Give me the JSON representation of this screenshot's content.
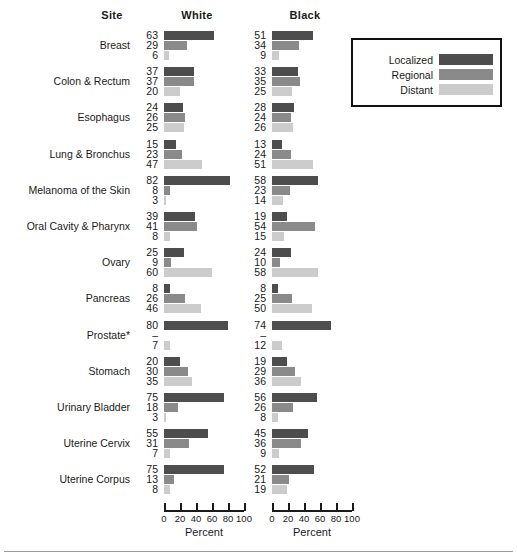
{
  "header": {
    "site_label": "Site",
    "white_label": "White",
    "black_label": "Black"
  },
  "legend": {
    "items": [
      {
        "label": "Localized",
        "color": "#4d4d4d"
      },
      {
        "label": "Regional",
        "color": "#8a8a8a"
      },
      {
        "label": "Distant",
        "color": "#cccccc"
      }
    ]
  },
  "axis": {
    "title": "Percent",
    "ticks": [
      "0",
      "20",
      "40",
      "60",
      "80",
      "100"
    ],
    "min": 0,
    "max": 100
  },
  "chart_data": {
    "type": "bar",
    "title": "",
    "subtitle": "",
    "xlabel": "Percent",
    "ylabel": "Site",
    "xlim": [
      0,
      100
    ],
    "grid": false,
    "orientation": "horizontal",
    "legend_position": "top-right",
    "panels": [
      "White",
      "Black"
    ],
    "stage_series": [
      "Localized",
      "Regional",
      "Distant"
    ],
    "categories": [
      "Breast",
      "Colon & Rectum",
      "Esophagus",
      "Lung & Bronchus",
      "Melanoma of the Skin",
      "Oral Cavity & Pharynx",
      "Ovary",
      "Pancreas",
      "Prostate*",
      "Stomach",
      "Urinary Bladder",
      "Uterine Cervix",
      "Uterine Corpus"
    ],
    "rows": [
      {
        "site": "Breast",
        "white": {
          "labels": [
            "63",
            "29",
            "6"
          ],
          "values": [
            63,
            29,
            6
          ]
        },
        "black": {
          "labels": [
            "51",
            "34",
            "9"
          ],
          "values": [
            51,
            34,
            9
          ]
        }
      },
      {
        "site": "Colon & Rectum",
        "white": {
          "labels": [
            "37",
            "37",
            "20"
          ],
          "values": [
            37,
            37,
            20
          ]
        },
        "black": {
          "labels": [
            "33",
            "35",
            "25"
          ],
          "values": [
            33,
            35,
            25
          ]
        }
      },
      {
        "site": "Esophagus",
        "white": {
          "labels": [
            "24",
            "26",
            "25"
          ],
          "values": [
            24,
            26,
            25
          ]
        },
        "black": {
          "labels": [
            "28",
            "24",
            "26"
          ],
          "values": [
            28,
            24,
            26
          ]
        }
      },
      {
        "site": "Lung & Bronchus",
        "white": {
          "labels": [
            "15",
            "23",
            "47"
          ],
          "values": [
            15,
            23,
            47
          ]
        },
        "black": {
          "labels": [
            "13",
            "24",
            "51"
          ],
          "values": [
            13,
            24,
            51
          ]
        }
      },
      {
        "site": "Melanoma of the Skin",
        "white": {
          "labels": [
            "82",
            "8",
            "3"
          ],
          "values": [
            82,
            8,
            3
          ]
        },
        "black": {
          "labels": [
            "58",
            "23",
            "14"
          ],
          "values": [
            58,
            23,
            14
          ]
        }
      },
      {
        "site": "Oral Cavity & Pharynx",
        "white": {
          "labels": [
            "39",
            "41",
            "8"
          ],
          "values": [
            39,
            41,
            8
          ]
        },
        "black": {
          "labels": [
            "19",
            "54",
            "15"
          ],
          "values": [
            19,
            54,
            15
          ]
        }
      },
      {
        "site": "Ovary",
        "white": {
          "labels": [
            "25",
            "9",
            "60"
          ],
          "values": [
            25,
            9,
            60
          ]
        },
        "black": {
          "labels": [
            "24",
            "10",
            "58"
          ],
          "values": [
            24,
            10,
            58
          ]
        }
      },
      {
        "site": "Pancreas",
        "white": {
          "labels": [
            "8",
            "26",
            "46"
          ],
          "values": [
            8,
            26,
            46
          ]
        },
        "black": {
          "labels": [
            "8",
            "25",
            "50"
          ],
          "values": [
            8,
            25,
            50
          ]
        }
      },
      {
        "site": "Prostate*",
        "white": {
          "labels": [
            "80",
            "–",
            "7"
          ],
          "values": [
            80,
            null,
            7
          ]
        },
        "black": {
          "labels": [
            "74",
            "–",
            "12"
          ],
          "values": [
            74,
            null,
            12
          ]
        }
      },
      {
        "site": "Stomach",
        "white": {
          "labels": [
            "20",
            "30",
            "35"
          ],
          "values": [
            20,
            30,
            35
          ]
        },
        "black": {
          "labels": [
            "19",
            "29",
            "36"
          ],
          "values": [
            19,
            29,
            36
          ]
        }
      },
      {
        "site": "Urinary Bladder",
        "white": {
          "labels": [
            "75",
            "18",
            "3"
          ],
          "values": [
            75,
            18,
            3
          ]
        },
        "black": {
          "labels": [
            "56",
            "26",
            "8"
          ],
          "values": [
            56,
            26,
            8
          ]
        }
      },
      {
        "site": "Uterine Cervix",
        "white": {
          "labels": [
            "55",
            "31",
            "7"
          ],
          "values": [
            55,
            31,
            7
          ]
        },
        "black": {
          "labels": [
            "45",
            "36",
            "9"
          ],
          "values": [
            45,
            36,
            9
          ]
        }
      },
      {
        "site": "Uterine Corpus",
        "white": {
          "labels": [
            "75",
            "13",
            "8"
          ],
          "values": [
            75,
            13,
            8
          ]
        },
        "black": {
          "labels": [
            "52",
            "21",
            "19"
          ],
          "values": [
            52,
            21,
            19
          ]
        }
      }
    ]
  }
}
